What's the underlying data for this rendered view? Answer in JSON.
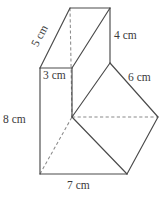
{
  "figure": {
    "kind": "composite-solid-3d-diagram",
    "units": "cm",
    "line_color": "#4a4a4a",
    "hidden_line_color": "#8a8a8a",
    "background_color": "#ffffff",
    "canvas": {
      "width": 167,
      "height": 204
    }
  },
  "labels": {
    "slant_top_left": "5 cm",
    "vertical_right_top": "4 cm",
    "depth_front_top": "3 cm",
    "slant_right": "6 cm",
    "vertical_left": "8 cm",
    "base_bottom": "7 cm"
  },
  "measurements": [
    {
      "name": "slant_top_left",
      "value": 5,
      "unit": "cm",
      "text": "5 cm"
    },
    {
      "name": "vertical_right_top",
      "value": 4,
      "unit": "cm",
      "text": "4 cm"
    },
    {
      "name": "depth_front_top",
      "value": 3,
      "unit": "cm",
      "text": "3 cm"
    },
    {
      "name": "slant_right",
      "value": 6,
      "unit": "cm",
      "text": "6 cm"
    },
    {
      "name": "vertical_left",
      "value": 8,
      "unit": "cm",
      "text": "8 cm"
    },
    {
      "name": "base_bottom",
      "value": 7,
      "unit": "cm",
      "text": "7 cm"
    }
  ],
  "vertices": {
    "top_back_left": [
      70,
      8
    ],
    "top_back_right": [
      110,
      8
    ],
    "top_front_left": [
      40,
      68
    ],
    "top_front_right": [
      72,
      68
    ],
    "top_mid_right": [
      110,
      63
    ],
    "center_junction": [
      72,
      117
    ],
    "right_apex": [
      158,
      117
    ],
    "bottom_front_left": [
      40,
      174
    ],
    "bottom_front_right": [
      127,
      174
    ]
  }
}
